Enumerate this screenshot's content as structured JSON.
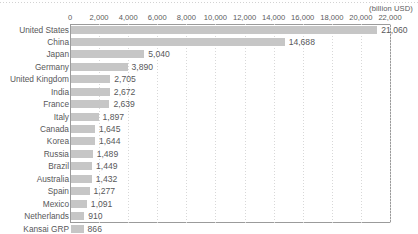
{
  "chart_data": {
    "type": "bar",
    "orientation": "horizontal",
    "title": "",
    "unit_label": "(billion USD)",
    "xlabel": "",
    "ylabel": "",
    "xlim": [
      0,
      22000
    ],
    "xtick_step": 2000,
    "xticks": [
      "0",
      "2,000",
      "4,000",
      "6,000",
      "8,000",
      "10,000",
      "12,000",
      "14,000",
      "16,000",
      "18,000",
      "20,000",
      "22,000"
    ],
    "grid": true,
    "grid_axis": "x",
    "legend": null,
    "bar_color": "#c6c6c6",
    "axis_color": "#9b9b9b",
    "text_color": "#58585a",
    "categories": [
      "United States",
      "China",
      "Japan",
      "Germany",
      "United Kingdom",
      "India",
      "France",
      "Italy",
      "Canada",
      "Korea",
      "Russia",
      "Brazil",
      "Australia",
      "Spain",
      "Mexico",
      "Netherlands",
      "Kansai GRP"
    ],
    "values": [
      21060,
      14688,
      5040,
      3890,
      2705,
      2672,
      2639,
      1897,
      1645,
      1644,
      1489,
      1449,
      1432,
      1277,
      1091,
      910,
      866
    ],
    "value_labels": [
      "21,060",
      "14,688",
      "5,040",
      "3,890",
      "2,705",
      "2,672",
      "2,639",
      "1,897",
      "1,645",
      "1,644",
      "1,489",
      "1,449",
      "1,432",
      "1,277",
      "1,091",
      "910",
      "866"
    ]
  }
}
